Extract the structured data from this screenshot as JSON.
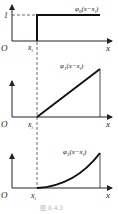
{
  "figure": {
    "caption": "图 8.4.3",
    "panels": [
      {
        "id": "phi0",
        "function_label": "φ0(x−x1)",
        "func_sym": "φ",
        "func_sub": "0",
        "func_arg": "(x−x",
        "func_arg_sub": "i",
        "func_arg_end": ")",
        "origin_label": "O",
        "x_axis_label": "x",
        "x_tick_label": "x",
        "x_tick_sub": "i",
        "y_tick_label": "1",
        "shape": "step"
      },
      {
        "id": "phi1",
        "function_label": "φ1(x−x1)",
        "func_sym": "φ",
        "func_sub": "1",
        "func_arg": "(x−x",
        "func_arg_sub": "i",
        "func_arg_end": ")",
        "origin_label": "O",
        "x_axis_label": "x",
        "x_tick_label": "x",
        "x_tick_sub": "i",
        "shape": "ramp"
      },
      {
        "id": "phi2",
        "function_label": "φ2(x−x1)",
        "func_sym": "φ",
        "func_sub": "2",
        "func_arg": "(x−x",
        "func_arg_sub": "i",
        "func_arg_end": ")",
        "origin_label": "O",
        "x_axis_label": "x",
        "x_tick_label": "x",
        "x_tick_sub": "i",
        "shape": "parabola"
      }
    ],
    "colors": {
      "ink": "#222222",
      "caption": "#bbbbbb"
    }
  }
}
